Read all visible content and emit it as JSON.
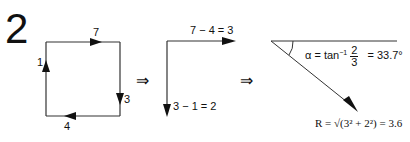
{
  "problem_number": "2",
  "panel1": {
    "top_label": "7",
    "right_label": "3",
    "bottom_label": "4",
    "left_label": "1"
  },
  "implies_1": "⇒",
  "panel2": {
    "horizontal_label": "7 − 4 = 3",
    "vertical_label": "3 − 1 = 2"
  },
  "implies_2": "⇒",
  "panel3": {
    "angle_prefix": "α = tan",
    "angle_sup": "−1",
    "frac_num": "2",
    "frac_den": "3",
    "angle_result": "= 33.7°",
    "resultant_label": "R = √(3² + 2²) = 3.6"
  },
  "colors": {
    "line": "#333333",
    "text": "#111111"
  }
}
